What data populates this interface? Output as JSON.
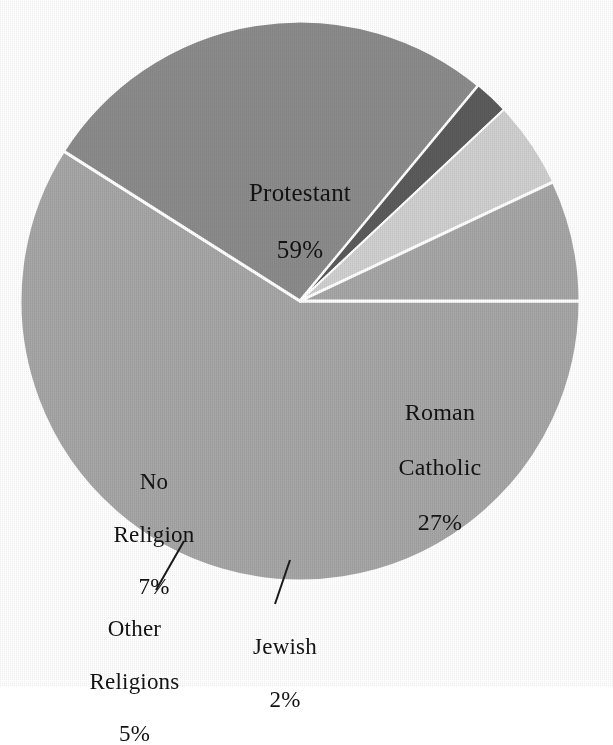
{
  "chart_data": {
    "type": "pie",
    "title": "",
    "subtitle": "",
    "xlabel": "",
    "ylabel": "",
    "legend_position": "none",
    "grid": false,
    "total_percent": 100,
    "units": "%",
    "categories": [
      "Protestant",
      "Roman Catholic",
      "Jewish",
      "Other Religions",
      "No Religion"
    ],
    "values": [
      59,
      27,
      2,
      5,
      7
    ],
    "slices": [
      {
        "name": "Protestant",
        "label_line1": "Protestant",
        "label_line2": "",
        "percent_text": "59%",
        "value": 59,
        "color": "#a6a6a6",
        "start_angle_deg": 0,
        "end_angle_deg": 212.4,
        "label_placement": "inside"
      },
      {
        "name": "Roman Catholic",
        "label_line1": "Roman",
        "label_line2": "Catholic",
        "percent_text": "27%",
        "value": 27,
        "color": "#8b8b8b",
        "start_angle_deg": 212.4,
        "end_angle_deg": 309.6,
        "label_placement": "inside"
      },
      {
        "name": "Jewish",
        "label_line1": "Jewish",
        "label_line2": "",
        "percent_text": "2%",
        "value": 2,
        "color": "#5b5b5b",
        "start_angle_deg": 309.6,
        "end_angle_deg": 316.8,
        "label_placement": "outside-leader"
      },
      {
        "name": "Other Religions",
        "label_line1": "Other",
        "label_line2": "Religions",
        "percent_text": "5%",
        "value": 5,
        "color": "#cfcfcf",
        "start_angle_deg": 316.8,
        "end_angle_deg": 334.8,
        "label_placement": "outside-leader"
      },
      {
        "name": "No Religion",
        "label_line1": "No",
        "label_line2": "Religion",
        "percent_text": "7%",
        "value": 7,
        "color": "#a6a6a6",
        "start_angle_deg": 334.8,
        "end_angle_deg": 360,
        "label_placement": "inside"
      }
    ],
    "colors": {
      "protestant": "#a6a6a6",
      "roman_catholic": "#8b8b8b",
      "jewish": "#5b5b5b",
      "other_religions": "#cfcfcf",
      "no_religion": "#a6a6a6",
      "separator": "#ffffff",
      "background": "#ffffff",
      "text": "#131313",
      "leader_line": "#1a1a1a"
    },
    "geometry": {
      "center_x": 300,
      "center_y": 301,
      "radius": 280,
      "separator_width_px": 3
    }
  },
  "labels": {
    "protestant": {
      "name": "Protestant",
      "percent": "59%"
    },
    "roman_catholic": {
      "line1": "Roman",
      "line2": "Catholic",
      "percent": "27%"
    },
    "no_religion": {
      "line1": "No",
      "line2": "Religion",
      "percent": "7%"
    },
    "other_religions": {
      "line1": "Other",
      "line2": "Religions",
      "percent": "5%"
    },
    "jewish": {
      "name": "Jewish",
      "percent": "2%"
    }
  }
}
